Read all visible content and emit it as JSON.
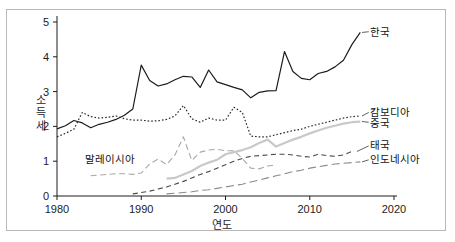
{
  "figure": {
    "frame_border_color": "#b9b9b9",
    "background": "#ffffff"
  },
  "chart_data": {
    "type": "line",
    "title": "",
    "subtitle": "",
    "xlabel": "연도",
    "ylabel": "소득세",
    "xlim": [
      1980,
      2020
    ],
    "ylim": [
      0,
      5
    ],
    "xticks": [
      1980,
      1990,
      2000,
      2010,
      2020
    ],
    "xtick_labels": [
      "1980",
      "1990",
      "2000",
      "2010",
      "2020"
    ],
    "yticks": [
      0,
      1,
      2,
      3,
      4,
      5
    ],
    "ytick_labels": [
      "0",
      "1",
      "2",
      "3",
      "4",
      "5"
    ],
    "grid": false,
    "legend_position": "inline-right-labels",
    "series": [
      {
        "name": "한국",
        "label": "한국",
        "color": "#1c1c1c",
        "style": "solid",
        "dasharray": "",
        "width": 1.2,
        "label_x": 2017.2,
        "label_y": 4.72,
        "leader": [
          [
            2016.2,
            4.7
          ],
          [
            2017.0,
            4.72
          ]
        ],
        "x": [
          1980,
          1981,
          1982,
          1983,
          1984,
          1985,
          1986,
          1987,
          1988,
          1989,
          1990,
          1991,
          1992,
          1993,
          1994,
          1995,
          1996,
          1997,
          1998,
          1999,
          2000,
          2001,
          2002,
          2003,
          2004,
          2005,
          2006,
          2007,
          2008,
          2009,
          2010,
          2011,
          2012,
          2013,
          2014,
          2015,
          2016
        ],
        "y": [
          1.93,
          2.02,
          2.17,
          2.1,
          1.96,
          2.06,
          2.12,
          2.2,
          2.32,
          2.5,
          3.76,
          3.32,
          3.16,
          3.22,
          3.34,
          3.44,
          3.42,
          3.12,
          3.62,
          3.28,
          3.2,
          3.12,
          3.05,
          2.82,
          2.98,
          3.02,
          3.03,
          4.15,
          3.58,
          3.38,
          3.34,
          3.52,
          3.58,
          3.71,
          3.9,
          4.35,
          4.7
        ]
      },
      {
        "name": "캄보디아",
        "label": "캄보디아",
        "color": "#2b2b2b",
        "style": "dotted",
        "dasharray": "1.6 2.0",
        "width": 1.2,
        "label_x": 2017.2,
        "label_y": 2.42,
        "leader": [
          [
            2016.2,
            2.3
          ],
          [
            2017.0,
            2.4
          ]
        ],
        "x": [
          1980,
          1981,
          1982,
          1983,
          1984,
          1985,
          1986,
          1987,
          1988,
          1989,
          1990,
          1991,
          1992,
          1993,
          1994,
          1995,
          1996,
          1997,
          1998,
          1999,
          2000,
          2001,
          2002,
          2003,
          2004,
          2005,
          2006,
          2007,
          2008,
          2009,
          2010,
          2011,
          2012,
          2013,
          2014,
          2015,
          2016
        ],
        "y": [
          1.7,
          1.8,
          1.92,
          2.4,
          2.28,
          2.24,
          2.26,
          2.3,
          2.22,
          2.18,
          2.18,
          2.15,
          2.16,
          2.2,
          2.3,
          2.6,
          2.22,
          2.12,
          2.24,
          2.18,
          2.18,
          2.55,
          2.4,
          1.72,
          1.7,
          1.7,
          1.76,
          1.82,
          1.88,
          1.92,
          2.0,
          2.06,
          2.12,
          2.18,
          2.24,
          2.28,
          2.3
        ]
      },
      {
        "name": "중국",
        "label": "중국",
        "color": "#c9c9c9",
        "style": "solid-light",
        "dasharray": "",
        "width": 2.2,
        "label_x": 2017.2,
        "label_y": 2.1,
        "leader": [
          [
            2016.2,
            2.14
          ],
          [
            2017.0,
            2.12
          ]
        ],
        "x": [
          1993,
          1994,
          1995,
          1996,
          1997,
          1998,
          1999,
          2000,
          2001,
          2002,
          2003,
          2004,
          2005,
          2006,
          2007,
          2008,
          2009,
          2010,
          2011,
          2012,
          2013,
          2014,
          2015,
          2016
        ],
        "y": [
          0.5,
          0.52,
          0.62,
          0.72,
          0.86,
          0.96,
          1.04,
          1.2,
          1.26,
          1.32,
          1.4,
          1.52,
          1.62,
          1.42,
          1.52,
          1.62,
          1.7,
          1.8,
          1.88,
          1.96,
          2.02,
          2.08,
          2.12,
          2.14
        ]
      },
      {
        "name": "태국",
        "label": "태국",
        "color": "#4a4a4a",
        "style": "dashed",
        "dasharray": "5 3.5",
        "width": 1.1,
        "label_x": 2017.2,
        "label_y": 1.46,
        "leader": [
          [
            2015.6,
            1.28
          ],
          [
            2017.0,
            1.44
          ]
        ],
        "x": [
          1989,
          1990,
          1991,
          1992,
          1993,
          1994,
          1995,
          1996,
          1997,
          1998,
          1999,
          2000,
          2001,
          2002,
          2003,
          2004,
          2005,
          2006,
          2007,
          2008,
          2009,
          2010,
          2011,
          2012,
          2013,
          2014,
          2015
        ],
        "y": [
          0.06,
          0.1,
          0.14,
          0.2,
          0.26,
          0.34,
          0.42,
          0.52,
          0.62,
          0.7,
          0.8,
          0.9,
          1.0,
          1.08,
          1.14,
          1.16,
          1.18,
          1.2,
          1.2,
          1.18,
          1.14,
          1.12,
          1.2,
          1.16,
          1.14,
          1.18,
          1.28
        ]
      },
      {
        "name": "인도네시아",
        "label": "인도네시아",
        "color": "#8a8a8a",
        "style": "long-dashed",
        "dasharray": "8 4",
        "width": 1.1,
        "label_x": 2017.2,
        "label_y": 1.06,
        "leader": [
          [
            2016.2,
            0.98
          ],
          [
            2017.0,
            1.04
          ]
        ],
        "x": [
          1993,
          1994,
          1995,
          1996,
          1997,
          1998,
          1999,
          2000,
          2001,
          2002,
          2003,
          2004,
          2005,
          2006,
          2007,
          2008,
          2009,
          2010,
          2011,
          2012,
          2013,
          2014,
          2015,
          2016
        ],
        "y": [
          0.06,
          0.08,
          0.1,
          0.12,
          0.16,
          0.18,
          0.22,
          0.26,
          0.3,
          0.34,
          0.4,
          0.46,
          0.52,
          0.58,
          0.64,
          0.7,
          0.74,
          0.8,
          0.84,
          0.88,
          0.92,
          0.94,
          0.96,
          0.98
        ]
      },
      {
        "name": "말레이시아",
        "label": "말레이시아",
        "color": "#a8a8a8",
        "style": "dashed",
        "dasharray": "6 3.5",
        "width": 1.1,
        "label_x": 1986.3,
        "label_y": 1.05,
        "leader": [],
        "x": [
          1984,
          1985,
          1986,
          1987,
          1988,
          1989,
          1990,
          1991,
          1992,
          1993,
          1994,
          1995,
          1996,
          1997,
          1998,
          1999,
          2000,
          2001,
          2002,
          2003,
          2004,
          2005,
          2006
        ],
        "y": [
          0.58,
          0.6,
          0.62,
          0.64,
          0.64,
          0.62,
          0.66,
          0.92,
          1.06,
          0.9,
          1.18,
          1.7,
          1.02,
          1.26,
          1.32,
          1.34,
          1.3,
          1.3,
          1.08,
          0.8,
          0.78,
          0.86,
          0.9
        ]
      }
    ],
    "labels_text": {
      "korea": "한국",
      "cambodia": "캄보디아",
      "china": "중국",
      "thailand": "태국",
      "indonesia": "인도네시아",
      "malaysia": "말레이시아"
    }
  }
}
